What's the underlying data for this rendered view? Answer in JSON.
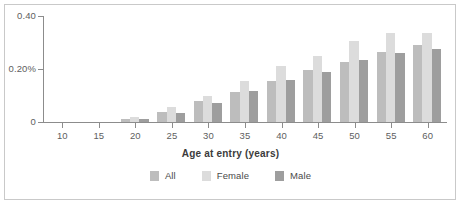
{
  "chart_data": {
    "type": "bar",
    "title": "",
    "subtitle": "",
    "xlabel": "Age at entry (years)",
    "ylabel": "",
    "categories": [
      10,
      15,
      20,
      25,
      30,
      35,
      40,
      45,
      50,
      55,
      60
    ],
    "xlim": [
      7.5,
      62.5
    ],
    "ylim": [
      0,
      0.4
    ],
    "yticks": [
      0,
      0.2,
      0.4
    ],
    "ytick_labels": [
      "0",
      "0.20%",
      "0.40"
    ],
    "xticks": [
      10,
      15,
      20,
      25,
      30,
      35,
      40,
      45,
      50,
      55,
      60
    ],
    "xtick_labels": [
      "10",
      "15",
      "20",
      "25",
      "30",
      "35",
      "40",
      "45",
      "50",
      "55",
      "60"
    ],
    "grid": false,
    "legend_position": "bottom",
    "series": [
      {
        "name": "All",
        "color": "#bdbdbd",
        "values": [
          0.0,
          0.0,
          0.012,
          0.037,
          0.078,
          0.115,
          0.155,
          0.195,
          0.225,
          0.265,
          0.29
        ]
      },
      {
        "name": "Female",
        "color": "#dcdcdc",
        "values": [
          0.0,
          0.0,
          0.02,
          0.058,
          0.1,
          0.155,
          0.21,
          0.25,
          0.305,
          0.335,
          0.335
        ]
      },
      {
        "name": "Male",
        "color": "#9e9e9e",
        "values": [
          0.0,
          0.0,
          0.01,
          0.033,
          0.072,
          0.118,
          0.158,
          0.19,
          0.235,
          0.26,
          0.275
        ]
      }
    ]
  },
  "legend": {
    "items": [
      {
        "label": "All",
        "color": "#bdbdbd"
      },
      {
        "label": "Female",
        "color": "#dcdcdc"
      },
      {
        "label": "Male",
        "color": "#9e9e9e"
      }
    ]
  }
}
